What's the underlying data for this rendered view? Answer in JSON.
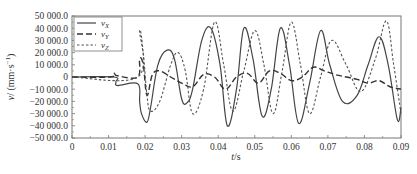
{
  "chart_data": {
    "type": "line",
    "title": "",
    "xlabel": "t/s",
    "ylabel": "v/ (mm·s⁻¹)",
    "xlim": [
      0,
      0.09
    ],
    "ylim": [
      -50000,
      50000
    ],
    "grid": false,
    "legend_position": "upper-left",
    "x_ticks": [
      0,
      0.01,
      0.02,
      0.03,
      0.04,
      0.05,
      0.06,
      0.07,
      0.08,
      0.09
    ],
    "x_tick_labels": [
      "0",
      "0.01",
      "0.02",
      "0.03",
      "0.04",
      "0.05",
      "0.06",
      "0.07",
      "0.08",
      "0.09"
    ],
    "y_ticks": [
      50000,
      40000,
      30000,
      20000,
      10000,
      0,
      -10000,
      -20000,
      -30000,
      -40000,
      -50000
    ],
    "y_tick_labels": [
      "50 000.0",
      "40 000.0",
      "30 000.0",
      "20 000.0",
      "10 000.0",
      "0",
      "−10 000.0",
      "−20 000.0",
      "−30 000.0",
      "−40 000.0",
      "−50 000.0"
    ],
    "series": [
      {
        "name": "v_X",
        "label_main": "v",
        "label_sub": "X",
        "style": "solid",
        "color": "#444444",
        "x": [
          0,
          0.0115,
          0.012,
          0.0125,
          0.018,
          0.0185,
          0.019,
          0.0205,
          0.0215,
          0.0235,
          0.026,
          0.028,
          0.03,
          0.0315,
          0.033,
          0.0355,
          0.038,
          0.0405,
          0.0425,
          0.045,
          0.047,
          0.0495,
          0.052,
          0.0545,
          0.057,
          0.0595,
          0.062,
          0.065,
          0.068,
          0.0705,
          0.074,
          0.078,
          0.081,
          0.084,
          0.0865,
          0.089,
          0.09
        ],
        "y": [
          0,
          0,
          -4000,
          -7000,
          -5500,
          -20000,
          -30000,
          -37000,
          -25000,
          10000,
          22000,
          15000,
          -18000,
          -21000,
          -10000,
          30000,
          40000,
          10000,
          -40000,
          -10000,
          40000,
          15000,
          -32000,
          -10000,
          40000,
          10000,
          -38000,
          -5000,
          38000,
          10000,
          -20000,
          -15000,
          10000,
          33000,
          10000,
          -35000,
          -25000
        ]
      },
      {
        "name": "v_Y",
        "label_main": "v",
        "label_sub": "Y",
        "style": "long-dash",
        "color": "#333333",
        "x": [
          0,
          0.0105,
          0.0115,
          0.0125,
          0.018,
          0.0185,
          0.0195,
          0.0205,
          0.022,
          0.024,
          0.027,
          0.03,
          0.033,
          0.036,
          0.039,
          0.042,
          0.045,
          0.048,
          0.051,
          0.054,
          0.057,
          0.06,
          0.063,
          0.066,
          0.069,
          0.072,
          0.075,
          0.078,
          0.081,
          0.084,
          0.087,
          0.09
        ],
        "y": [
          0,
          0,
          3000,
          1000,
          0,
          15000,
          10000,
          -15000,
          2000,
          5000,
          0,
          -5000,
          -8000,
          2000,
          0,
          -10000,
          0,
          3000,
          -5000,
          5000,
          3000,
          -3000,
          0,
          8000,
          5000,
          2000,
          0,
          -2000,
          -5000,
          -3000,
          -8000,
          -10000
        ]
      },
      {
        "name": "v_Z",
        "label_main": "v",
        "label_sub": "Z",
        "style": "short-dash",
        "color": "#555555",
        "x": [
          0,
          0.018,
          0.0185,
          0.0195,
          0.0205,
          0.0215,
          0.024,
          0.027,
          0.029,
          0.031,
          0.033,
          0.036,
          0.039,
          0.0415,
          0.044,
          0.047,
          0.05,
          0.0525,
          0.055,
          0.0575,
          0.06,
          0.0625,
          0.065,
          0.068,
          0.071,
          0.075,
          0.079,
          0.083,
          0.086,
          0.088,
          0.09
        ],
        "y": [
          0,
          0,
          38000,
          20000,
          -15000,
          -28000,
          -20000,
          10000,
          20000,
          5000,
          -30000,
          -10000,
          45000,
          10000,
          -28000,
          5000,
          38000,
          10000,
          -30000,
          5000,
          45000,
          10000,
          -30000,
          0,
          30000,
          10000,
          -12000,
          15000,
          46000,
          10000,
          -30000
        ]
      }
    ]
  },
  "legend": {
    "items": [
      {
        "main": "v",
        "sub": "X"
      },
      {
        "main": "v",
        "sub": "Y"
      },
      {
        "main": "v",
        "sub": "Z"
      }
    ]
  },
  "axes": {
    "xlabel_main": "t",
    "xlabel_unit": "/s",
    "ylabel_main": "v",
    "ylabel_unit": "/ (mm·s",
    "ylabel_exp": "−1",
    "ylabel_close": ")"
  }
}
